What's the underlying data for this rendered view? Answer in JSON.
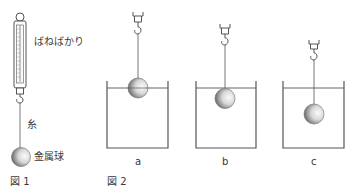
{
  "figure1": {
    "caption": "図 1",
    "labels": {
      "spring_scale": "ばねばかり",
      "thread": "糸",
      "metal_ball": "金属球"
    }
  },
  "figure2": {
    "caption": "図 2",
    "beakers": [
      {
        "label": "a",
        "ball_position": "half-submerged at water surface"
      },
      {
        "label": "b",
        "ball_position": "just fully submerged below surface"
      },
      {
        "label": "c",
        "ball_position": "deeply submerged"
      }
    ]
  },
  "colors": {
    "line": "#555555",
    "ball_dark": "#6a6a6a",
    "ball_light": "#f2f2f2"
  }
}
